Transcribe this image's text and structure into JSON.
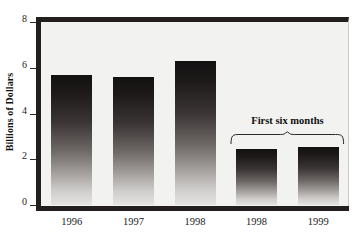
{
  "chart_data": {
    "type": "bar",
    "title": "",
    "subtitle": "",
    "xlabel": "",
    "ylabel": "Billions of Dollars",
    "categories": [
      "1996",
      "1997",
      "1998",
      "1998",
      "1999"
    ],
    "values": [
      5.7,
      5.6,
      6.3,
      2.45,
      2.55
    ],
    "ylim": [
      0,
      8
    ],
    "yticks": [
      0,
      2,
      4,
      6,
      8
    ],
    "ytick_labels": [
      "0",
      "2",
      "4",
      "6",
      "8"
    ],
    "grid": false,
    "legend": null,
    "annotations": [
      {
        "text": "First six months",
        "covers_categories": [
          "1998",
          "1999"
        ],
        "covers_indices": [
          3,
          4
        ],
        "style": "curly-brace-above-bars"
      }
    ],
    "series": [
      {
        "name": "Billions of Dollars",
        "values": [
          5.7,
          5.6,
          6.3,
          2.45,
          2.55
        ]
      }
    ],
    "bar_fill": "vertical gradient black to light gray",
    "colors": {
      "bar_top": "#131111",
      "bar_bottom": "#e6e4e2",
      "plot_background": "#f2f2f0",
      "frame": "#231f1e",
      "text": "#111111"
    }
  },
  "axis": {
    "y_title": "Billions of Dollars"
  }
}
